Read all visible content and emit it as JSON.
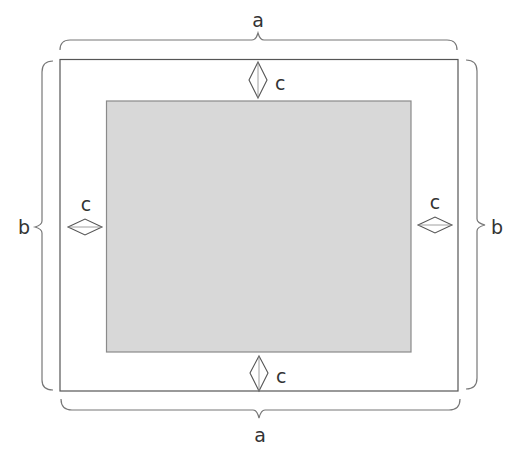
{
  "diagram": {
    "title": "",
    "outer_frame": {
      "x": 60,
      "y": 59,
      "width": 398,
      "height": 332,
      "stroke": "#555555"
    },
    "inner_panel": {
      "x": 106,
      "y": 101,
      "width": 305,
      "height": 251,
      "fill": "#d8d8d8",
      "stroke": "#888888"
    },
    "dimensions": {
      "top": {
        "label": "a",
        "measures": "outer frame width"
      },
      "bottom": {
        "label": "a",
        "measures": "outer frame width"
      },
      "left": {
        "label": "b",
        "measures": "outer frame height"
      },
      "right": {
        "label": "b",
        "measures": "outer frame height"
      },
      "margin_top": {
        "label": "c",
        "measures": "gap between outer frame and inner panel (top)"
      },
      "margin_bottom": {
        "label": "c",
        "measures": "gap between outer frame and inner panel (bottom)"
      },
      "margin_left": {
        "label": "c",
        "measures": "gap between outer frame and inner panel (left)"
      },
      "margin_right": {
        "label": "c",
        "measures": "gap between outer frame and inner panel (right)"
      }
    },
    "colors": {
      "line": "#666666",
      "text": "#333333",
      "panel_fill": "#d8d8d8"
    }
  }
}
